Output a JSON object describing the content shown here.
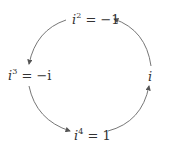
{
  "diagram": {
    "title": "",
    "type": "cycle",
    "nodes": [
      {
        "id": "top",
        "base": "i",
        "exponent": "2",
        "rhs": " = −1"
      },
      {
        "id": "left",
        "base": "i",
        "exponent": "3",
        "rhs": " = −i"
      },
      {
        "id": "bottom",
        "base": "i",
        "exponent": "4",
        "rhs": " = 1"
      },
      {
        "id": "right",
        "base": "i",
        "exponent": "",
        "rhs": ""
      }
    ],
    "edges": [
      {
        "from": "top",
        "to": "left"
      },
      {
        "from": "left",
        "to": "bottom"
      },
      {
        "from": "bottom",
        "to": "right"
      },
      {
        "from": "right",
        "to": "top"
      }
    ],
    "colors": {
      "line": "#555555",
      "text": "#333333"
    }
  }
}
